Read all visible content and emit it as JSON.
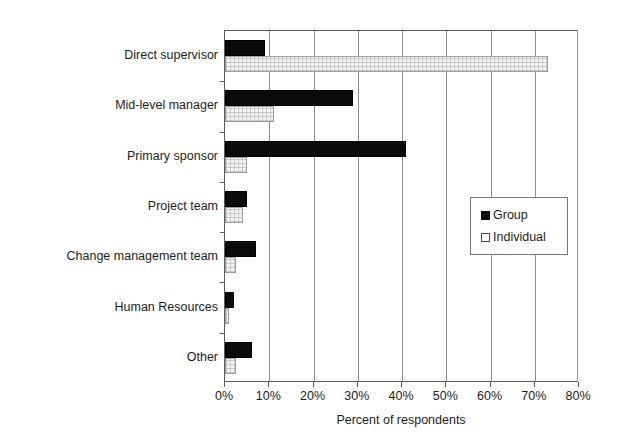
{
  "chart_data": {
    "type": "bar",
    "orientation": "horizontal",
    "title": "",
    "xlabel": "Percent of respondents",
    "ylabel": "",
    "xlim": [
      0,
      80
    ],
    "xtick_labels": [
      "0%",
      "10%",
      "20%",
      "30%",
      "40%",
      "50%",
      "60%",
      "70%",
      "80%"
    ],
    "xtick_values": [
      0,
      10,
      20,
      30,
      40,
      50,
      60,
      70,
      80
    ],
    "grid": true,
    "grid_axis": "x",
    "legend_position": "center-right",
    "categories": [
      "Direct supervisor",
      "Mid-level manager",
      "Primary sponsor",
      "Project team",
      "Change management team",
      "Human Resources",
      "Other"
    ],
    "series": [
      {
        "name": "Group",
        "color": "#0b0b0b",
        "values": [
          9,
          29,
          41,
          5,
          7,
          2,
          6
        ]
      },
      {
        "name": "Individual",
        "color": "#f3f3f3",
        "values": [
          73,
          11,
          5,
          4,
          2.5,
          1,
          2.5
        ]
      }
    ]
  },
  "legend": {
    "entries": [
      {
        "label": "Group"
      },
      {
        "label": "Individual"
      }
    ]
  },
  "colors": {
    "group": "#0b0b0b",
    "individual": "#f3f3f3",
    "axis": "#5d5d5d",
    "grid": "#8c8c8c",
    "text": "#1d1d1d",
    "background": "#ffffff"
  }
}
